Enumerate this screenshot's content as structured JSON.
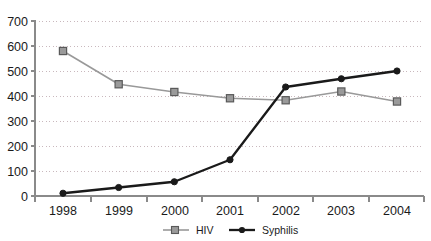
{
  "chart_data": {
    "type": "line",
    "title": "",
    "subtitle": "",
    "xlabel": "",
    "ylabel": "",
    "categories": [
      "1998",
      "1999",
      "2000",
      "2001",
      "2002",
      "2003",
      "2004"
    ],
    "series": [
      {
        "name": "HIV",
        "color": "#999999",
        "marker": "square",
        "marker_fill": "#9a9a9a",
        "marker_stroke": "#5a5a5a",
        "values": [
          580,
          447,
          416,
          391,
          383,
          418,
          378
        ]
      },
      {
        "name": "Syphilis",
        "color": "#1a1a1a",
        "marker": "circle",
        "marker_fill": "#1a1a1a",
        "marker_stroke": "#1a1a1a",
        "values": [
          11,
          34,
          57,
          145,
          436,
          469,
          500
        ]
      }
    ],
    "ylim": [
      0,
      700
    ],
    "ytick_values": [
      0,
      100,
      200,
      300,
      400,
      500,
      600,
      700
    ],
    "ytick_labels": [
      "0",
      "100",
      "200",
      "300",
      "400",
      "500",
      "600",
      "700"
    ],
    "xtick_labels": [
      "1998",
      "1999",
      "2000",
      "2001",
      "2002",
      "2003",
      "2004"
    ],
    "grid": true,
    "grid_axis": "y",
    "grid_color": "#c9b8bd",
    "legend": [
      "HIV",
      "Syphilis"
    ],
    "legend_position": "bottom"
  },
  "legend": {
    "items": [
      {
        "label": "HIV"
      },
      {
        "label": "Syphilis"
      }
    ]
  },
  "axes": {
    "y": {
      "ticks": [
        "700",
        "600",
        "500",
        "400",
        "300",
        "200",
        "100",
        "0"
      ]
    },
    "x": {
      "ticks": [
        "1998",
        "1999",
        "2000",
        "2001",
        "2002",
        "2003",
        "2004"
      ]
    }
  }
}
